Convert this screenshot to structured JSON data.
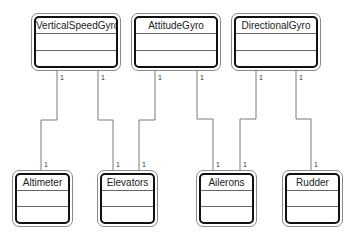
{
  "diagram": {
    "type": "UML class diagram",
    "classes": [
      {
        "id": "vsg",
        "name": "VerticalSpeedGyro",
        "x": 31,
        "y": 13,
        "w": 90,
        "h": 58
      },
      {
        "id": "att",
        "name": "AttitudeGyro",
        "x": 131,
        "y": 13,
        "w": 90,
        "h": 58
      },
      {
        "id": "dir",
        "name": "DirectionalGyro",
        "x": 231,
        "y": 13,
        "w": 90,
        "h": 58
      },
      {
        "id": "alt",
        "name": "Altimeter",
        "x": 12,
        "y": 170,
        "w": 61,
        "h": 57
      },
      {
        "id": "elv",
        "name": "Elevators",
        "x": 97,
        "y": 170,
        "w": 61,
        "h": 57
      },
      {
        "id": "ail",
        "name": "Ailerons",
        "x": 196,
        "y": 170,
        "w": 61,
        "h": 57
      },
      {
        "id": "rud",
        "name": "Rudder",
        "x": 282,
        "y": 170,
        "w": 61,
        "h": 57
      }
    ],
    "associations": [
      {
        "from": "VerticalSpeedGyro",
        "to": "Altimeter",
        "from_mult": "1",
        "to_mult": "1"
      },
      {
        "from": "VerticalSpeedGyro",
        "to": "Elevators",
        "from_mult": "1",
        "to_mult": "1"
      },
      {
        "from": "AttitudeGyro",
        "to": "Elevators",
        "from_mult": "1",
        "to_mult": "1"
      },
      {
        "from": "AttitudeGyro",
        "to": "Ailerons",
        "from_mult": "1",
        "to_mult": "1"
      },
      {
        "from": "DirectionalGyro",
        "to": "Ailerons",
        "from_mult": "1",
        "to_mult": "1"
      },
      {
        "from": "DirectionalGyro",
        "to": "Rudder",
        "from_mult": "1",
        "to_mult": "1"
      }
    ]
  }
}
